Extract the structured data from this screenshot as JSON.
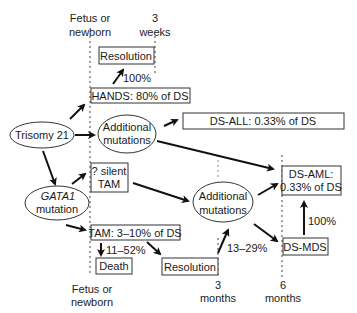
{
  "timeline": {
    "top_left": [
      "Fetus or",
      "newborn"
    ],
    "top_right": [
      "3",
      "weeks"
    ],
    "bottom_left": [
      "Fetus or",
      "newborn"
    ],
    "bottom_mid": [
      "3",
      "months"
    ],
    "bottom_right": [
      "6",
      "months"
    ]
  },
  "nodes": {
    "trisomy": "Trisomy 21",
    "gata1": [
      "GATA1",
      "mutation"
    ],
    "additional_top": [
      "Additional",
      "mutations"
    ],
    "additional_bottom": [
      "Additional",
      "mutations"
    ],
    "resolution_top": "Resolution",
    "hands": "HANDS: 80% of DS",
    "ds_all": "DS-ALL: 0.33% of DS",
    "silent_tam": [
      "? silent",
      "TAM"
    ],
    "ds_aml": [
      "DS-AML:",
      "0.33% of DS"
    ],
    "tam": "TAM: 3–10% of DS",
    "death": "Death",
    "resolution_bottom": "Resolution",
    "ds_mds": "DS-MDS"
  },
  "edges": {
    "hands_to_resolution": "100%",
    "tam_to_death": "11–52%",
    "resolution_to_additional": "13–29%",
    "mds_to_aml": "100%"
  }
}
